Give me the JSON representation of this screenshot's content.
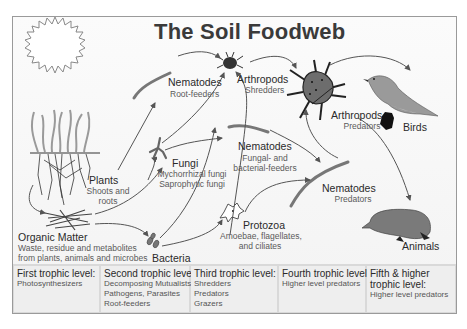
{
  "title": "The Soil Foodweb",
  "nodes": {
    "plants": {
      "label": "Plants",
      "sub1": "Shoots and",
      "sub2": "roots"
    },
    "organic_matter": {
      "label": "Organic Matter",
      "sub1": "Waste, residue  and metabolites",
      "sub2": "from plants, animals and microbes"
    },
    "bacteria": {
      "label": "Bacteria"
    },
    "fungi": {
      "label": "Fungi",
      "sub1": "Mychorrhizal fungi",
      "sub2": "Saprophytic fungi"
    },
    "nematodes_root": {
      "label": "Nematodes",
      "sub1": "Root-feeders"
    },
    "arthropods_shredders": {
      "label": "Arthropods",
      "sub1": "Shredders"
    },
    "nematodes_fungal": {
      "label": "Nematodes",
      "sub1": "Fungal- and",
      "sub2": "bacterial-feeders"
    },
    "protozoa": {
      "label": "Protozoa",
      "sub1": "Amoebae, flagellates,",
      "sub2": "and ciliates"
    },
    "nematodes_predators": {
      "label": "Nematodes",
      "sub1": "Predators"
    },
    "arthropods_predators": {
      "label": "Arthropods",
      "sub1": "Predators"
    },
    "birds": {
      "label": "Birds"
    },
    "animals": {
      "label": "Animals"
    }
  },
  "trophic_levels": [
    {
      "heading": "First trophic level:",
      "items": [
        "Photosynthesizers"
      ]
    },
    {
      "heading": "Second trophic level:",
      "items": [
        "Decomposing Mutualists",
        "Pathogens, Parasites",
        "Root-feeders"
      ]
    },
    {
      "heading": "Third trophic level:",
      "items": [
        "Shredders",
        "Predators",
        "Grazers"
      ]
    },
    {
      "heading": "Fourth trophic level:",
      "items": [
        "Higher level predators"
      ]
    },
    {
      "heading_line1": "Fifth & higher",
      "heading_line2": "trophic level:",
      "items": [
        "Higher level predators"
      ]
    }
  ],
  "icons": [
    "sun-icon",
    "plant-icon",
    "organic-matter-icon",
    "bacteria-icon",
    "fungi-icon",
    "nematode-icon",
    "arthropod-icon",
    "protozoa-icon",
    "bird-icon",
    "mole-icon"
  ],
  "colors": {
    "frame": "#9a9a9a",
    "title": "#3a3a3a",
    "arrow": "#555555",
    "organism": "#6a6a6a"
  }
}
